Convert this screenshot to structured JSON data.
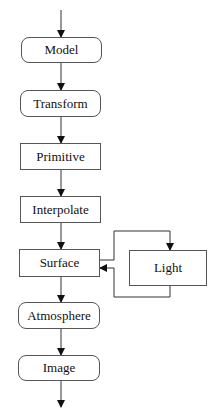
{
  "diagram": {
    "type": "flowchart",
    "nodes": [
      {
        "id": "model",
        "label": "Model",
        "shape": "rounded"
      },
      {
        "id": "transform",
        "label": "Transform",
        "shape": "rounded"
      },
      {
        "id": "primitive",
        "label": "Primitive",
        "shape": "rect"
      },
      {
        "id": "interpolate",
        "label": "Interpolate",
        "shape": "rect"
      },
      {
        "id": "surface",
        "label": "Surface",
        "shape": "rect"
      },
      {
        "id": "light",
        "label": "Light",
        "shape": "rect"
      },
      {
        "id": "atmosphere",
        "label": "Atmosphere",
        "shape": "rounded"
      },
      {
        "id": "image",
        "label": "Image",
        "shape": "rounded"
      }
    ],
    "edges": [
      {
        "from": "input",
        "to": "model"
      },
      {
        "from": "model",
        "to": "transform"
      },
      {
        "from": "transform",
        "to": "primitive"
      },
      {
        "from": "primitive",
        "to": "interpolate"
      },
      {
        "from": "interpolate",
        "to": "surface"
      },
      {
        "from": "surface",
        "to": "light"
      },
      {
        "from": "light",
        "to": "surface"
      },
      {
        "from": "surface",
        "to": "atmosphere"
      },
      {
        "from": "atmosphere",
        "to": "image"
      },
      {
        "from": "image",
        "to": "output"
      }
    ]
  }
}
